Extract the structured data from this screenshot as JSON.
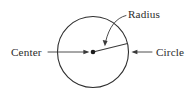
{
  "diagram": {
    "type": "geometry-circle-annotated",
    "background_color": "#ffffff",
    "stroke_color": "#2e2e2e",
    "text_color": "#2b2b2b",
    "shape": {
      "name": "circle",
      "center_x": 93,
      "center_y": 52,
      "radius": 35.5,
      "stroke_width": 1.1
    },
    "center_point": {
      "x": 93,
      "y": 52,
      "dot_radius": 2.3
    },
    "radius_segment": {
      "from_x": 93,
      "from_y": 52,
      "to_x": 127.5,
      "to_y": 43.5
    },
    "labels": [
      {
        "id": "center",
        "text": "Center",
        "x": 11,
        "y": 56,
        "anchor": "start",
        "leader": {
          "kind": "straight-arrow",
          "from_x": 48,
          "from_y": 52,
          "to_x": 88.5,
          "to_y": 52,
          "direction": "right"
        }
      },
      {
        "id": "radius",
        "text": "Radius",
        "x": 128,
        "y": 18,
        "anchor": "start",
        "leader": {
          "kind": "curved-arrow",
          "path": "M 126 15.5 C 116 18 109 27 105.5 42",
          "to_x": 104.8,
          "to_y": 45.5,
          "direction": "down-left"
        }
      },
      {
        "id": "circle",
        "text": "Circle",
        "x": 156,
        "y": 56,
        "anchor": "start",
        "leader": {
          "kind": "straight-arrow",
          "from_x": 152,
          "from_y": 52,
          "to_x": 131.5,
          "to_y": 52,
          "direction": "left"
        }
      }
    ]
  }
}
